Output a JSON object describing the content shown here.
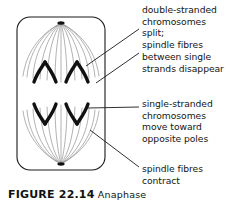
{
  "figure": {
    "caption": "FIGURE 22.14",
    "caption_rest": "  Anaphase",
    "cell_outline_color": "#1a1a1a",
    "chromosome_color": "#111111",
    "spindle_fibre_color": "#8a8a8a",
    "leader_line_color": "#1a1a1a",
    "text_color": "#141414",
    "background_color": "#ffffff"
  },
  "annotations": {
    "top": {
      "label": "double-stranded chromosomes split; spindle fibres between single strands disappear",
      "lines": [
        "double-stranded",
        "chromosomes",
        "split;",
        "spindle fibres",
        "between single",
        "strands disappear"
      ],
      "text": "double-stranded\nchromosomes\nsplit;\nspindle fibres\nbetween single\nstrands disappear"
    },
    "middle": {
      "label": "single-stranded chromosomes move toward opposite poles",
      "lines": [
        "single-stranded",
        "chromosomes",
        "move toward",
        "opposite poles"
      ],
      "text": "single-stranded\nchromosomes\nmove toward\nopposite poles"
    },
    "bottom": {
      "label": "spindle fibres contract",
      "lines": [
        "spindle fibres",
        "contract"
      ],
      "text": "spindle fibres\ncontract"
    }
  },
  "diagram": {
    "cell_shape": "rounded-rectangle",
    "poles": 2,
    "chromosomes_top": 2,
    "chromosomes_bottom": 2,
    "chromosome_shape": "v-shaped",
    "spindle_fibre_count": 18
  }
}
